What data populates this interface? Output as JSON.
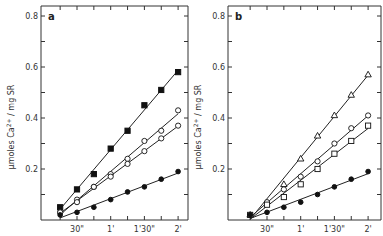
{
  "chart_data": [
    {
      "type": "scatter",
      "panel_label": "a",
      "title": "",
      "xlabel": "",
      "ylabel": "µmoles Ca2+ / mg SR",
      "ylabel_parts": {
        "pre": "µmoles  Ca",
        "sup": "2+",
        "post": " / mg  SR"
      },
      "x_tick_labels": [
        "30\"",
        "1'",
        "1'30\"",
        "2'"
      ],
      "x_tick_seconds": [
        30,
        60,
        90,
        120
      ],
      "y_tick_labels": [
        "0.2",
        "0.4",
        "0.6",
        "0.8"
      ],
      "y_tick_values": [
        0.2,
        0.4,
        0.6,
        0.8
      ],
      "xlim_seconds": [
        0,
        127
      ],
      "ylim": [
        0,
        0.84
      ],
      "grid": false,
      "x": [
        15,
        30,
        45,
        60,
        75,
        90,
        105,
        120
      ],
      "series": [
        {
          "name": "filled squares",
          "marker": "square-filled",
          "values": [
            0.05,
            0.12,
            0.18,
            0.28,
            0.35,
            0.45,
            0.51,
            0.58
          ]
        },
        {
          "name": "open circles (upper)",
          "marker": "circle-open",
          "values": [
            0.03,
            0.08,
            0.13,
            0.18,
            0.24,
            0.31,
            0.35,
            0.43
          ]
        },
        {
          "name": "open circles (lower)",
          "marker": "circle-open",
          "values": [
            0.03,
            0.07,
            0.13,
            0.17,
            0.22,
            0.27,
            0.32,
            0.37
          ]
        },
        {
          "name": "filled circles",
          "marker": "circle-filled",
          "values": [
            0.02,
            0.03,
            0.05,
            0.08,
            0.11,
            0.13,
            0.16,
            0.19
          ]
        }
      ]
    },
    {
      "type": "scatter",
      "panel_label": "b",
      "title": "",
      "xlabel": "",
      "ylabel": "µmoles Ca2+ / mg SR",
      "ylabel_parts": {
        "pre": "µmoles  Ca",
        "sup": "2+",
        "post": " / mg  SR"
      },
      "x_tick_labels": [
        "30\"",
        "1'",
        "1'30\"",
        "2'"
      ],
      "x_tick_seconds": [
        30,
        60,
        90,
        120
      ],
      "y_tick_labels": [
        "0.2",
        "0.4",
        "0.6",
        "0.8"
      ],
      "y_tick_values": [
        0.2,
        0.4,
        0.6,
        0.8
      ],
      "xlim_seconds": [
        0,
        127
      ],
      "ylim": [
        0,
        0.84
      ],
      "grid": false,
      "x": [
        15,
        30,
        45,
        60,
        75,
        90,
        105,
        120
      ],
      "series": [
        {
          "name": "open triangles",
          "marker": "triangle-open",
          "values": [
            0.02,
            null,
            0.14,
            0.24,
            0.33,
            0.41,
            0.49,
            0.57
          ]
        },
        {
          "name": "open circles",
          "marker": "circle-open",
          "values": [
            0.02,
            0.07,
            0.12,
            0.17,
            0.23,
            0.3,
            0.36,
            0.41
          ]
        },
        {
          "name": "open squares",
          "marker": "square-open",
          "values": [
            0.02,
            0.06,
            0.09,
            0.14,
            0.2,
            0.26,
            0.31,
            0.37
          ]
        },
        {
          "name": "filled circles",
          "marker": "circle-filled",
          "values": [
            0.02,
            0.03,
            0.05,
            0.07,
            0.1,
            0.13,
            0.16,
            0.19
          ]
        }
      ]
    }
  ]
}
